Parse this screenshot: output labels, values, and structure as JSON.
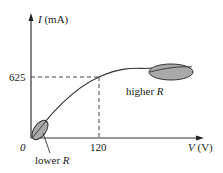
{
  "diagram": {
    "y_axis": {
      "symbol": "I",
      "unit": "(mA)"
    },
    "x_axis": {
      "symbol": "V",
      "unit": "(V)"
    },
    "origin_label": "0",
    "y_marker": "625",
    "x_marker": "120",
    "regions": [
      {
        "label_text": "higher ",
        "label_symbol": "R"
      },
      {
        "label_text": "lower ",
        "label_symbol": "R"
      }
    ],
    "colors": {
      "ellipse_fill": "#a9a9a9",
      "line": "#333333"
    }
  }
}
